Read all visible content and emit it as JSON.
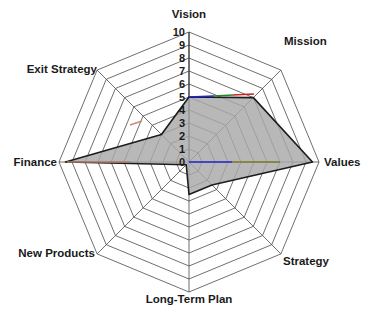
{
  "chart_data": {
    "type": "radar",
    "title": "",
    "subtitle": "",
    "xlabel": "",
    "ylabel": "",
    "categories": [
      "Vision",
      "Mission",
      "Values",
      "Strategy",
      "Long-Term Plan",
      "New Products",
      "Finance",
      "Exit Strategy"
    ],
    "series": [
      {
        "name": "Score",
        "values": [
          5,
          7,
          9.5,
          2.5,
          2.5,
          0.3,
          9.5,
          3
        ]
      }
    ],
    "tick_labels": [
      "10",
      "9",
      "8",
      "7",
      "6",
      "5",
      "4",
      "3",
      "2",
      "1",
      "0"
    ],
    "rlim": [
      0,
      10
    ],
    "rticks": [
      0,
      1,
      2,
      3,
      4,
      5,
      6,
      7,
      8,
      9,
      10
    ],
    "grid": true,
    "grid_shape": "polygon",
    "legend": false,
    "legend_position": "none",
    "start_angle_deg": 90,
    "direction": "clockwise"
  },
  "chart": {
    "axis_labels": {
      "vision": "Vision",
      "mission": "Mission",
      "values": "Values",
      "strategy": "Strategy",
      "long_term_plan": "Long-Term Plan",
      "new_products": "New Products",
      "finance": "Finance",
      "exit_strategy": "Exit Strategy"
    },
    "ticks": {
      "t10": "10",
      "t9": "9",
      "t8": "8",
      "t7": "7",
      "t6": "6",
      "t5": "5",
      "t4": "4",
      "t3": "3",
      "t2": "2",
      "t1": "1",
      "t0": "0"
    },
    "colors": {
      "series_fill": "#a8a8a8",
      "series_stroke": "#1c1c1c",
      "grid": "#4a4a4a",
      "text": "#1a1a1a",
      "background": "#ffffff",
      "accent_blue": "#2222cc",
      "accent_red": "#cc2222",
      "accent_green": "#228822"
    }
  }
}
